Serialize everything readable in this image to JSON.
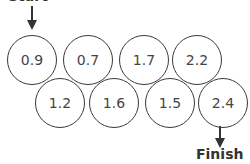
{
  "diagram": {
    "start_label": "Start",
    "finish_label": "Finish",
    "top_row": [
      {
        "value": "0.9",
        "x": 32,
        "y": 60
      },
      {
        "value": "0.7",
        "x": 88,
        "y": 60
      },
      {
        "value": "1.7",
        "x": 144,
        "y": 60
      },
      {
        "value": "2.2",
        "x": 197,
        "y": 60
      }
    ],
    "bottom_row": [
      {
        "value": "1.2",
        "x": 60,
        "y": 103
      },
      {
        "value": "1.6",
        "x": 114,
        "y": 103
      },
      {
        "value": "1.5",
        "x": 170,
        "y": 103
      },
      {
        "value": "2.4",
        "x": 223,
        "y": 103
      }
    ],
    "colors": {
      "stroke": "#3a3a3a",
      "text": "#444444"
    }
  }
}
